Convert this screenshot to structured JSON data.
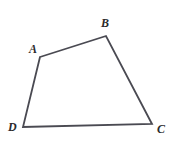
{
  "figure": {
    "type": "quadrilateral",
    "background_color": "#ffffff",
    "stroke_color": "#4a4a52",
    "stroke_width": 1.8,
    "label_color": "#2b2b2b",
    "vertices": [
      {
        "id": "A",
        "label": "A",
        "x": 40,
        "y": 57,
        "label_x": 29,
        "label_y": 43
      },
      {
        "id": "B",
        "label": "B",
        "x": 106,
        "y": 36,
        "label_x": 101,
        "label_y": 17
      },
      {
        "id": "C",
        "label": "C",
        "x": 152,
        "y": 124,
        "label_x": 157,
        "label_y": 123
      },
      {
        "id": "D",
        "label": "D",
        "x": 23,
        "y": 127,
        "label_x": 8,
        "label_y": 121
      }
    ],
    "edges": [
      {
        "id": "AB",
        "from": "A",
        "to": "B"
      },
      {
        "id": "BC",
        "from": "B",
        "to": "C"
      },
      {
        "id": "CD",
        "from": "C",
        "to": "D"
      },
      {
        "id": "DA",
        "from": "D",
        "to": "A"
      }
    ],
    "path": "M 40,57 L 106,36 L 152,124 L 23,127 Z"
  }
}
